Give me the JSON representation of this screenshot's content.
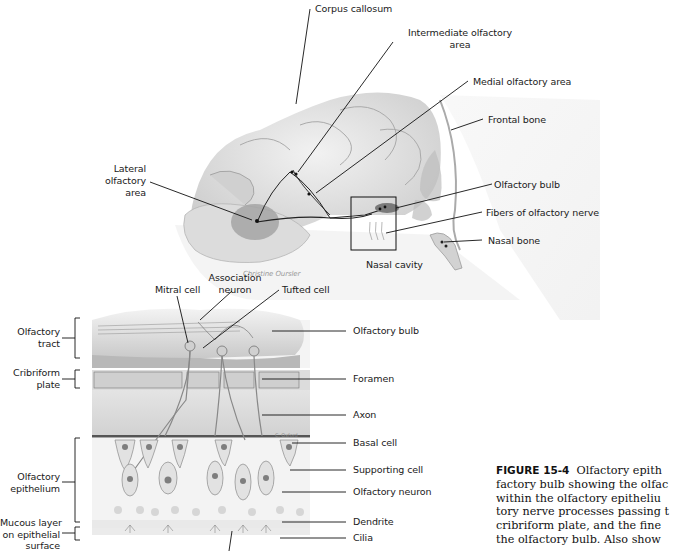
{
  "figure": {
    "number": "FIGURE 15-4",
    "caption_lines": [
      "Olfactory epith",
      "factory bulb showing the olfac",
      "within the olfactory epitheliu",
      "tory nerve processes passing t",
      "cribriform plate, and the fine",
      "the olfactory bulb. Also show"
    ],
    "signature_top": "Christine Oursler",
    "signature_bottom": "C. Oxford"
  },
  "top_diagram": {
    "labels": {
      "corpus_callosum": "Corpus callosum",
      "intermediate_1": "Intermediate olfactory",
      "intermediate_2": "area",
      "medial": "Medial olfactory area",
      "frontal_bone": "Frontal bone",
      "lateral_1": "Lateral",
      "lateral_2": "olfactory",
      "lateral_3": "area",
      "olfactory_bulb": "Olfactory bulb",
      "fibers": "Fibers of olfactory nerve",
      "nasal_bone": "Nasal bone",
      "nasal_cavity": "Nasal cavity"
    }
  },
  "bottom_diagram": {
    "labels": {
      "mitral_cell": "Mitral cell",
      "association_1": "Association",
      "association_2": "neuron",
      "tufted_cell": "Tufted cell",
      "olfactory_tract_1": "Olfactory",
      "olfactory_tract_2": "tract",
      "cribriform_1": "Cribriform",
      "cribriform_2": "plate",
      "olfactory_epithelium_1": "Olfactory",
      "olfactory_epithelium_2": "epithelium",
      "mucous_1": "Mucous layer",
      "mucous_2": "on epithelial",
      "mucous_3": "surface",
      "olfactory_bulb": "Olfactory bulb",
      "foramen": "Foramen",
      "axon": "Axon",
      "basal_cell": "Basal cell",
      "supporting_cell": "Supporting cell",
      "olfactory_neuron": "Olfactory neuron",
      "dendrite": "Dendrite",
      "cilia": "Cilia"
    }
  },
  "colors": {
    "line": "#1a1a1a",
    "shade_light": "#e6e6e6",
    "shade_mid": "#c8c8c8",
    "shade_dark": "#9a9a9a"
  }
}
